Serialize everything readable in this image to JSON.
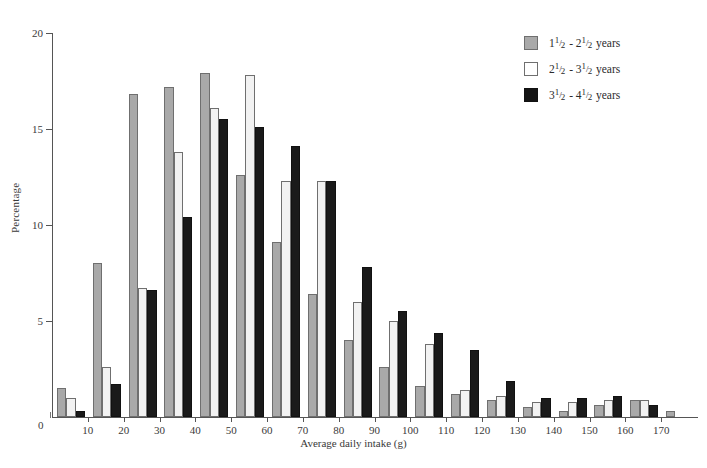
{
  "chart_data": {
    "type": "bar",
    "title": "",
    "xlabel": "Average daily intake (g)",
    "ylabel": "Percentage",
    "xlim": [
      0,
      180
    ],
    "ylim": [
      0,
      20
    ],
    "ytick_values": [
      0,
      5,
      10,
      15,
      20
    ],
    "ytick_labels": [
      "0",
      "5",
      "10",
      "15",
      "20"
    ],
    "xtick_values": [
      0,
      10,
      20,
      30,
      40,
      50,
      60,
      70,
      80,
      90,
      100,
      110,
      120,
      130,
      140,
      150,
      160,
      170
    ],
    "xtick_labels": [
      "0",
      "10",
      "20",
      "30",
      "40",
      "50",
      "60",
      "70",
      "80",
      "90",
      "100",
      "110",
      "120",
      "130",
      "140",
      "150",
      "160",
      "170"
    ],
    "grid": false,
    "legend_position": "top-right",
    "categories": [
      "0-10",
      "10-20",
      "20-30",
      "30-40",
      "40-50",
      "50-60",
      "60-70",
      "70-80",
      "80-90",
      "90-100",
      "100-110",
      "110-120",
      "120-130",
      "130-140",
      "140-150",
      "150-160",
      "160-170",
      "170-180"
    ],
    "series": [
      {
        "name": "1½ - 2½ years",
        "color": "#a9a9a9",
        "values": [
          1.5,
          8.0,
          16.8,
          17.2,
          17.9,
          12.6,
          9.1,
          6.4,
          4.0,
          2.6,
          1.6,
          1.2,
          0.9,
          0.5,
          0.3,
          0.6,
          0.9,
          0.3
        ]
      },
      {
        "name": "2½ - 3½ years",
        "color": "#f2f2f2",
        "values": [
          1.0,
          2.6,
          6.7,
          13.8,
          16.1,
          17.8,
          12.3,
          12.3,
          6.0,
          5.0,
          3.8,
          1.4,
          1.1,
          0.8,
          0.8,
          0.9,
          0.9,
          0.0
        ]
      },
      {
        "name": "3½ - 4½ years",
        "color": "#141414",
        "values": [
          0.3,
          1.7,
          6.6,
          10.4,
          15.5,
          15.1,
          14.1,
          12.3,
          7.8,
          5.5,
          4.4,
          3.5,
          1.9,
          1.0,
          1.0,
          1.1,
          0.6,
          0.0
        ]
      }
    ]
  },
  "legend": {
    "items": [
      {
        "range_low_whole": "1",
        "range_high_whole": "2",
        "numerator": "1",
        "denominator": "2",
        "unit": "years",
        "swatch": "gray"
      },
      {
        "range_low_whole": "2",
        "range_high_whole": "3",
        "numerator": "1",
        "denominator": "2",
        "unit": "years",
        "swatch": "white"
      },
      {
        "range_low_whole": "3",
        "range_high_whole": "4",
        "numerator": "1",
        "denominator": "2",
        "unit": "years",
        "swatch": "black"
      }
    ]
  },
  "axes": {
    "origin_label": "0"
  }
}
